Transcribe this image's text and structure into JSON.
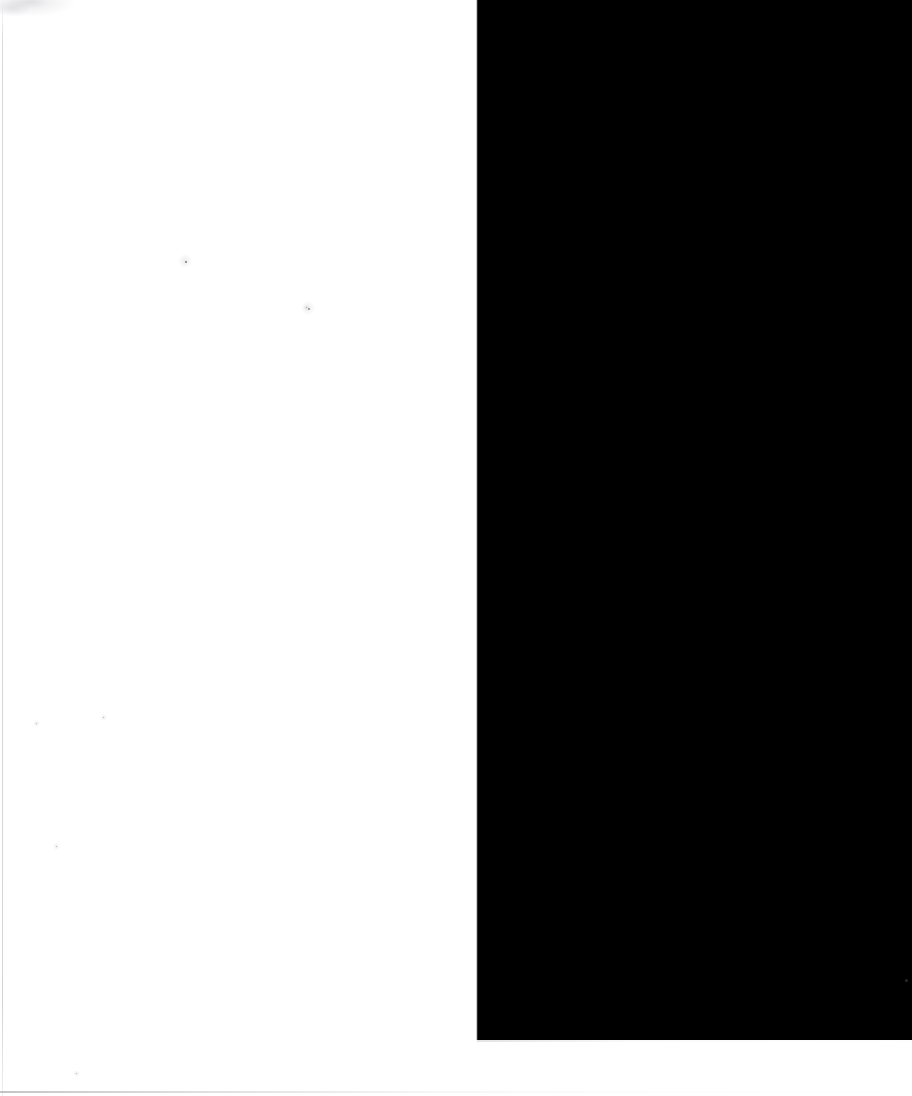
{
  "page": {
    "label": "Scanned blank page",
    "width_px": 912,
    "height_px": 1096,
    "background_color": "#ffffff",
    "content_text": ""
  },
  "paper": {
    "label": "Blank paper area",
    "x_px": 0,
    "y_px": 0,
    "width_px": 477,
    "height_px": 1096,
    "fill_color": "#ffffff",
    "text": ""
  },
  "paper_edges": [
    {
      "name": "left-edge-shadow",
      "orientation": "vertical",
      "x_px": 2,
      "y_px": 0,
      "length_px": 1096,
      "thickness_px": 1,
      "color": "#a0a0a5"
    },
    {
      "name": "bottom-edge-shadow",
      "orientation": "horizontal",
      "x_px": 0,
      "y_px": 1091,
      "length_px": 912,
      "thickness_px": 2,
      "color": "#96969b"
    }
  ],
  "void": {
    "label": "Black scanner void",
    "x_px": 477,
    "y_px": 0,
    "width_px": 435,
    "height_px": 1040,
    "fill_color": "#000000",
    "seam_left_color": "#d7d7da",
    "seam_bottom_color": "#cdcdd0"
  },
  "artifacts": {
    "corner_smudge": {
      "name": "top-left-smudge",
      "x_px": 0,
      "y_px": 0,
      "width_px": 78,
      "height_px": 34,
      "color": "#96969e"
    },
    "specks": [
      {
        "name": "speck-a",
        "x_px": 185,
        "y_px": 261,
        "size_px": 2,
        "color": "#76767e"
      },
      {
        "name": "speck-b",
        "x_px": 306,
        "y_px": 307,
        "size_px": 1,
        "color": "#9a9aa2"
      },
      {
        "name": "speck-c",
        "x_px": 308,
        "y_px": 308,
        "size_px": 2,
        "color": "#8c8c94"
      },
      {
        "name": "speck-d",
        "x_px": 103,
        "y_px": 717,
        "size_px": 1,
        "color": "#a8a8b0"
      },
      {
        "name": "speck-e",
        "x_px": 56,
        "y_px": 846,
        "size_px": 1,
        "color": "#aeaeb6"
      },
      {
        "name": "speck-f",
        "x_px": 36,
        "y_px": 723,
        "size_px": 1,
        "color": "#b2b2ba"
      },
      {
        "name": "speck-g",
        "x_px": 76,
        "y_px": 1073,
        "size_px": 1,
        "color": "#b4b4bb"
      },
      {
        "name": "speck-void",
        "x_px": 905,
        "y_px": 979,
        "size_px": 3,
        "color": "#2a2a2e"
      }
    ]
  }
}
